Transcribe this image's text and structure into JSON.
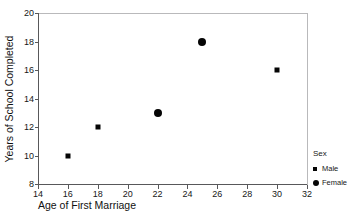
{
  "chart_data": {
    "type": "scatter",
    "title": "",
    "xlabel": "Age of First Marriage",
    "ylabel": "Years of School Completed",
    "xlim": [
      14,
      32
    ],
    "ylim": [
      8,
      20
    ],
    "xticks": [
      14,
      16,
      18,
      20,
      22,
      24,
      26,
      28,
      30,
      32
    ],
    "yticks": [
      8,
      10,
      12,
      14,
      16,
      18,
      20
    ],
    "grid": false,
    "legend": {
      "title": "Sex",
      "position": "right",
      "entries": [
        {
          "name": "Male",
          "marker": "square"
        },
        {
          "name": "Female",
          "marker": "circle"
        }
      ]
    },
    "series": [
      {
        "name": "Male",
        "marker": "square",
        "color": "#050505",
        "points": [
          {
            "x": 16,
            "y": 10
          },
          {
            "x": 18,
            "y": 12
          },
          {
            "x": 30,
            "y": 16
          }
        ]
      },
      {
        "name": "Female",
        "marker": "circle",
        "color": "#050505",
        "points": [
          {
            "x": 22,
            "y": 13
          },
          {
            "x": 25,
            "y": 18
          }
        ]
      }
    ]
  },
  "axes": {
    "x_tick_labels": [
      "14",
      "16",
      "18",
      "20",
      "22",
      "24",
      "26",
      "28",
      "30",
      "32"
    ],
    "y_tick_labels": [
      "8",
      "10",
      "12",
      "14",
      "16",
      "18",
      "20"
    ],
    "x_title": "Age of First Marriage",
    "y_title": "Years of School Completed"
  },
  "legend": {
    "title": "Sex",
    "male_label": "Male",
    "female_label": "Female"
  },
  "colors": {
    "marker": "#050505",
    "axis": "#58585a",
    "frame": "#b9b9bb",
    "background": "#ffffff"
  }
}
